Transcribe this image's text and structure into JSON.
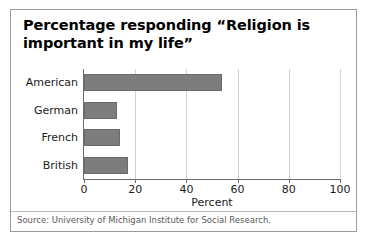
{
  "figure": {
    "title": "Percentage responding “Religion is important in my life”",
    "source": "Source: University of Michigan Institute for Social Research.",
    "border_color": "#9a9a9a",
    "bar_color": "#7d7d7d",
    "grid_color": "#d2d2d2",
    "axis_color": "#6d6d6d"
  },
  "chart_data": {
    "type": "bar",
    "orientation": "horizontal",
    "title": "Percentage responding “Religion is important in my life”",
    "categories": [
      "American",
      "German",
      "French",
      "British"
    ],
    "values": [
      54,
      13,
      14,
      17
    ],
    "series": [
      {
        "name": "Percent",
        "values": [
          54,
          13,
          14,
          17
        ]
      }
    ],
    "xlabel": "Percent",
    "ylabel": "",
    "xlim": [
      0,
      100
    ],
    "xticks": [
      0,
      20,
      40,
      60,
      80,
      100
    ],
    "xtick_labels": [
      "0",
      "20",
      "40",
      "60",
      "80",
      "100"
    ],
    "grid": "vertical",
    "legend": "none",
    "annotations": [
      "Source: University of Michigan Institute for Social Research."
    ]
  }
}
